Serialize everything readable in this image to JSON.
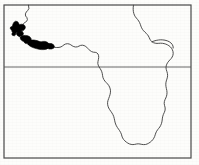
{
  "figure": {
    "description": "Outline map of western, central and southern Africa inside a rectangular frame, with a horizontal latitude line crossing the map and a solid black shaded distribution range along the Upper Guinea coast of West Africa.",
    "width_px": 199,
    "height_px": 165
  },
  "style": {
    "background_color": "#fdfdfb",
    "frame_color": "#4a4a4a",
    "coastline_color": "#3a3a3a",
    "latitude_line_color": "#555555",
    "range_fill_color": "#000000",
    "frame_stroke_width": 1.2,
    "coastline_stroke_width": 0.9,
    "latitude_stroke_width": 0.9
  },
  "map": {
    "frame": {
      "name": "map-frame",
      "x": 4,
      "y": 5,
      "width": 187,
      "height": 153
    },
    "latitude_line": {
      "name": "equator-line",
      "label": "equator",
      "y": 67,
      "x_start": 4,
      "x_end": 191
    },
    "coastline": {
      "name": "africa-coastline",
      "path": "M 28.5 5.2 L 28.9 8.6 L 27.6 10.6 L 26.3 12.0 L 25.4 13.9 L 25.6 16.0 L 26.9 17.6 L 27.4 19.6 L 26.6 21.4 L 25.0 22.4 L 23.5 23.6 L 22.6 25.3 L 22.4 27.2 L 23.2 28.8 L 23.1 30.5 L 21.8 31.8 L 20.2 32.8 L 19.0 34.2 L 18.9 36.0 L 20.0 37.3 L 21.8 38.0 L 23.8 38.6 L 25.9 39.4 L 28.1 40.4 L 30.4 41.4 L 32.8 42.3 L 35.2 43.1 L 37.6 43.9 L 40.0 44.6 L 42.4 45.2 L 44.8 45.8 L 47.2 46.3 L 49.6 46.7 L 52.0 47.0 L 54.4 47.3 L 56.8 47.5 L 59.0 47.4 L 61.0 46.9 L 62.6 45.9 L 64.0 44.8 L 65.6 44.0 L 67.4 43.7 L 69.2 44.0 L 70.8 44.8 L 72.2 45.8 L 73.8 46.6 L 75.6 47.0 L 77.4 46.8 L 79.0 46.1 L 80.6 45.4 L 82.4 45.2 L 84.2 45.6 L 85.8 46.5 L 87.2 47.8 L 88.6 49.2 L 90.0 50.5 L 91.6 51.6 L 93.4 52.2 L 95.2 52.3 L 96.8 52.8 L 98.0 54.0 L 98.6 55.7 L 98.7 57.6 L 98.4 59.5 L 98.0 61.4 L 97.8 63.3 L 98.2 65.1 L 99.0 66.8 L 100.0 68.4 L 101.0 70.0 L 101.8 71.8 L 102.3 73.7 L 102.6 75.7 L 103.0 77.7 L 103.8 79.5 L 104.9 81.1 L 106.2 82.5 L 107.5 83.9 L 108.7 85.4 L 109.6 87.1 L 110.2 88.9 L 110.5 90.8 L 110.4 92.8 L 110.0 94.7 L 109.4 96.6 L 108.7 98.5 L 108.0 100.4 L 107.6 102.3 L 107.6 104.3 L 108.0 106.2 L 108.7 108.0 L 109.7 109.7 L 110.8 111.3 L 111.9 112.9 L 112.9 114.6 L 113.7 116.4 L 114.2 118.3 L 114.6 120.2 L 115.0 122.1 L 115.6 124.0 L 116.4 125.8 L 117.4 127.5 L 118.5 129.1 L 119.6 130.7 L 120.6 132.4 L 121.4 134.2 L 121.9 136.1 L 122.6 137.9 L 123.6 139.5 L 124.9 140.9 L 126.3 142.1 L 127.8 143.1 L 129.4 143.9 L 131.1 144.4 L 132.9 144.6 L 134.7 144.4 L 136.4 144.0 L 138.2 143.8 L 140.0 144.0 L 141.8 144.4 L 143.6 144.6 L 145.4 144.5 L 147.1 144.0 L 148.7 143.2 L 150.2 142.2 L 151.6 141.0 L 152.8 139.7 L 153.8 138.2 L 154.6 136.6 L 155.2 134.8 L 155.8 133.0 L 156.6 131.3 L 157.6 129.8 L 158.7 128.4 L 159.8 127.0 L 160.7 125.4 L 161.4 123.7 L 161.9 121.9 L 162.2 120.0 L 162.4 118.1 L 162.8 116.2 L 163.4 114.4 L 164.2 112.7 L 164.9 110.9 L 165.2 109.0 L 165.0 107.1 L 164.5 105.3 L 164.2 103.4 L 164.4 101.5 L 165.0 99.7 L 165.8 98.0 L 166.5 96.2 L 166.9 94.3 L 167.0 92.4 L 166.8 90.5 L 166.4 88.6 L 166.0 86.7 L 165.8 84.8 L 165.9 82.8 L 166.3 80.9 L 166.9 79.1 L 167.4 77.2 L 167.6 75.3 L 167.4 73.4 L 166.9 71.5 L 166.3 69.7 L 166.0 67.8 L 166.2 65.9 L 166.8 64.1 L 167.7 62.5 L 168.8 61.1 L 170.0 59.8 L 171.2 58.5 L 172.2 57.0 L 172.9 55.3 L 173.2 53.5 L 173.0 51.6 L 172.4 49.8 L 171.5 48.2 L 170.3 46.8 L 168.9 45.7 L 167.4 44.8 L 165.8 44.1 L 164.1 43.6 L 162.4 43.3 L 160.6 43.2 L 158.8 43.3 L 157.0 43.4 L 155.2 43.2 L 153.5 42.7 L 152.0 41.8 L 150.8 40.6 L 149.9 39.2 L 149.2 37.6 L 148.4 36.0 L 147.4 34.6 L 146.2 33.3 L 144.9 32.1 L 143.6 30.8 L 142.5 29.4 L 141.6 27.8 L 140.9 26.1 L 140.3 24.3 L 139.6 22.6 L 138.7 21.0 L 137.6 19.5 L 136.4 18.1 L 135.3 16.7 L 134.4 15.1 L 133.8 13.4 L 133.4 11.6 L 133.2 9.7 L 133.2 7.8 L 133.4 5.8 L 133.5 5.2"
    },
    "east_inlet": {
      "name": "gulf-of-aden-inlet",
      "path": "M 152.0 41.8 L 154.0 41.0 L 156.2 40.4 L 158.4 40.0 L 160.6 39.8 L 162.8 39.9 L 165.0 40.2 L 167.2 40.8 L 169.2 41.7 L 170.9 42.9 L 172.2 44.4 L 173.0 46.1 L 173.2 48.0"
    },
    "range_polygons": [
      {
        "name": "range-patch-upper-guinea-north",
        "path": "M 13.8 22.4 L 15.6 21.2 L 17.4 21.6 L 18.6 23.0 L 19.2 24.8 L 20.4 25.8 L 22.0 25.6 L 23.2 26.4 L 23.6 28.2 L 22.8 29.8 L 21.2 30.6 L 19.4 31.0 L 17.6 31.8 L 16.2 33.0 L 14.6 33.6 L 13.0 33.0 L 12.0 31.6 L 11.6 29.8 L 11.8 28.0 L 12.4 26.2 L 12.8 24.4 Z"
      },
      {
        "name": "range-patch-upper-guinea-bulge",
        "path": "M 19.0 25.0 L 21.0 24.2 L 23.0 24.4 L 24.6 25.4 L 25.4 27.0 L 25.0 28.8 L 23.6 30.0 L 21.8 30.4 L 20.0 30.0 L 18.8 28.8 L 18.4 27.0 Z"
      },
      {
        "name": "range-patch-liberia",
        "path": "M 17.0 32.6 L 19.0 31.4 L 21.0 31.0 L 22.6 31.8 L 23.4 33.4 L 23.0 35.0 L 21.6 36.0 L 19.8 36.4 L 18.0 36.0 L 16.8 34.8 L 16.4 33.6 Z"
      },
      {
        "name": "range-patch-ivory-coast",
        "path": "M 20.8 36.6 L 23.0 35.6 L 25.4 35.4 L 27.8 35.8 L 29.8 36.8 L 31.0 38.4 L 31.2 40.2 L 30.0 41.6 L 28.0 42.2 L 25.8 42.2 L 23.6 41.6 L 21.8 40.6 L 20.6 39.2 L 20.2 37.8 Z"
      },
      {
        "name": "range-patch-ghana-coast",
        "path": "M 28.0 40.8 L 31.0 40.0 L 34.0 40.0 L 37.0 40.6 L 39.8 41.6 L 42.4 42.8 L 44.8 44.0 L 46.8 45.2 L 48.0 46.6 L 48.0 48.2 L 46.4 49.2 L 44.0 49.6 L 41.4 49.6 L 38.8 49.2 L 36.2 48.6 L 33.6 47.8 L 31.2 46.8 L 29.2 45.6 L 27.8 44.2 L 27.2 42.6 Z"
      },
      {
        "name": "range-patch-togo-benin",
        "path": "M 40.0 42.2 L 42.6 41.4 L 45.2 41.4 L 47.4 42.2 L 48.8 43.6 L 49.0 45.2 L 48.0 46.6 L 46.2 47.4 L 44.0 47.4 L 42.0 46.8 L 40.4 45.6 L 39.6 44.0 Z"
      },
      {
        "name": "range-patch-nigeria-west",
        "path": "M 46.4 44.2 L 49.0 43.4 L 51.6 43.6 L 53.6 44.8 L 54.4 46.6 L 53.6 48.2 L 51.6 49.0 L 49.2 49.0 L 47.2 48.2 L 46.0 46.6 Z"
      },
      {
        "name": "range-patch-small-island-a",
        "path": "M 16.8 29.6 L 18.6 28.8 L 20.2 29.4 L 20.8 31.0 L 19.8 32.4 L 18.0 32.6 L 16.6 31.6 L 16.2 30.4 Z"
      },
      {
        "name": "range-patch-small-island-b",
        "path": "M 33.8 43.0 L 35.8 42.4 L 37.6 43.0 L 38.2 44.6 L 37.2 46.0 L 35.2 46.2 L 33.6 45.2 L 33.2 44.0 Z"
      },
      {
        "name": "range-patch-speck-c",
        "path": "M 10.6 27.0 L 12.2 26.4 L 13.4 27.2 L 13.6 28.8 L 12.4 29.8 L 10.8 29.4 L 10.2 28.2 Z"
      },
      {
        "name": "range-patch-speck-d",
        "path": "M 24.6 40.8 L 26.4 40.2 L 27.8 41.0 L 28.0 42.6 L 26.8 43.6 L 25.0 43.2 L 24.2 42.0 Z"
      },
      {
        "name": "range-patch-speck-e",
        "path": "M 12.2 33.0 L 14.0 32.4 L 15.4 33.2 L 15.6 34.8 L 14.4 35.8 L 12.6 35.4 L 11.8 34.2 Z"
      }
    ],
    "legend_items": [
      {
        "name": "range-swatch",
        "label": "distribution range",
        "color": "#000000"
      }
    ]
  }
}
